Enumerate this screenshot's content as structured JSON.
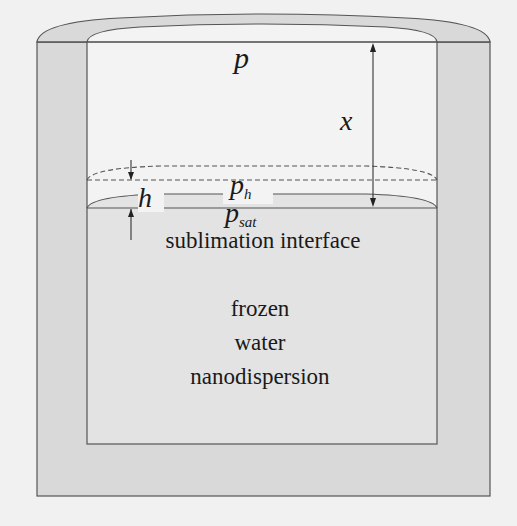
{
  "diagram": {
    "labels": {
      "top_pressure": "p",
      "distance": "x",
      "boundary_pressure_main": "p",
      "boundary_pressure_sub": "h",
      "boundary_thickness": "h",
      "sat_pressure_main": "p",
      "sat_pressure_sub": "sat",
      "interface": "sublimation interface",
      "material_line1": "frozen",
      "material_line2": "water",
      "material_line3": "nanodispersion"
    },
    "colors": {
      "background": "#f1f1f1",
      "container_wall": "#d9d9d9",
      "inner_space": "#f3f3f3",
      "frozen_region": "#e3e3e3",
      "stroke": "#555555"
    }
  }
}
